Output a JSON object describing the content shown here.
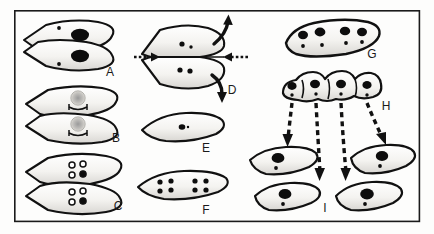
{
  "figure": {
    "name": "cell-division-diagram",
    "background_color": "#fdfdfc",
    "ink_color": "#111111",
    "cell_fill_color": "#f2f1ee",
    "frame": {
      "x": 14,
      "y": 10,
      "width": 406,
      "height": 212,
      "stroke_color": "#1a1a1a",
      "stroke_width": 1.6
    }
  },
  "labels": {
    "a": "A",
    "b": "B",
    "c": "C",
    "d": "D",
    "e": "E",
    "f": "F",
    "g": "G",
    "h": "H",
    "i": "I"
  },
  "panels": [
    {
      "id": "a",
      "label": "A",
      "label_x": 110,
      "label_y": 76,
      "description": "Two elongated cells stacked, each with one large dark nucleus and one small dot",
      "cell_count": 2,
      "large_nuclei_per_cell": 1,
      "small_dots_per_cell": 1
    },
    {
      "id": "b",
      "label": "B",
      "label_x": 116,
      "label_y": 142,
      "description": "Two stacked cells each with a stippled nucleus and a dumbbell spindle figure",
      "cell_count": 2,
      "large_nuclei_per_cell": 1,
      "small_dots_per_cell": 0
    },
    {
      "id": "c",
      "label": "C",
      "label_x": 118,
      "label_y": 210,
      "description": "Two stacked cells each with four small chromosome circles, one filled",
      "cell_count": 2,
      "large_nuclei_per_cell": 0,
      "small_dots_per_cell": 4
    },
    {
      "id": "d",
      "label": "D",
      "label_x": 232,
      "label_y": 94,
      "description": "Two cells separating with curved arrows up and down, and dashed arrows pushing inward from left and right",
      "cell_count": 2,
      "large_nuclei_per_cell": 0,
      "small_dots_per_cell": 3
    },
    {
      "id": "e",
      "label": "E",
      "label_x": 206,
      "label_y": 152,
      "description": "Single cell with one tiny central nucleus",
      "cell_count": 1,
      "large_nuclei_per_cell": 0,
      "small_dots_per_cell": 1
    },
    {
      "id": "f",
      "label": "F",
      "label_x": 206,
      "label_y": 214,
      "description": "Single cell containing two clusters of four dots each",
      "cell_count": 1,
      "large_nuclei_per_cell": 0,
      "small_dots_per_cell": 8
    },
    {
      "id": "g",
      "label": "G",
      "label_x": 372,
      "label_y": 58,
      "description": "Single long multinucleate cell with four large nuclei and four small dots",
      "cell_count": 1,
      "large_nuclei_per_cell": 4,
      "small_dots_per_cell": 4
    },
    {
      "id": "h",
      "label": "H",
      "label_x": 386,
      "label_y": 110,
      "description": "Chain of four budding cells each with a large nucleus and small dot, with four dashed arrows descending",
      "cell_count": 4,
      "large_nuclei_per_cell": 1,
      "small_dots_per_cell": 1
    },
    {
      "id": "i",
      "label": "I",
      "label_x": 325,
      "label_y": 212,
      "description": "Four separated daughter cells each with a large nucleus and small dot",
      "cell_count": 4,
      "large_nuclei_per_cell": 1,
      "small_dots_per_cell": 1
    }
  ],
  "arrows": {
    "dashed_inward": [
      {
        "name": "arrow-in-left",
        "from_x": 136,
        "to_x": 156,
        "y": 57
      },
      {
        "name": "arrow-in-right",
        "from_x": 242,
        "to_x": 222,
        "y": 57
      }
    ],
    "curved_split": [
      {
        "name": "arrow-split-up"
      },
      {
        "name": "arrow-split-down"
      }
    ],
    "dashed_descending_count": 4
  }
}
